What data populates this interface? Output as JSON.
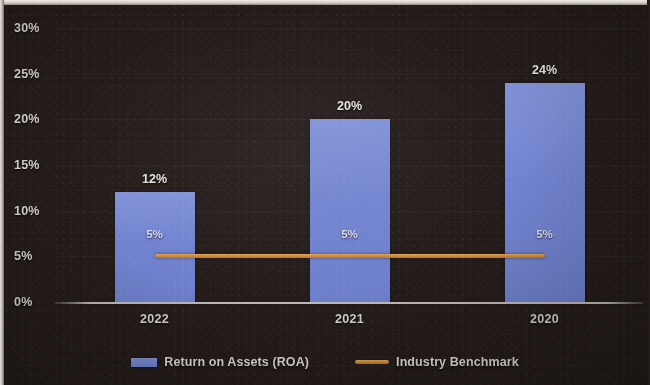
{
  "chart_data": {
    "type": "bar",
    "title": "",
    "xlabel": "",
    "ylabel": "",
    "categories": [
      "2022",
      "2021",
      "2020"
    ],
    "ylim": [
      0,
      30
    ],
    "ytick_labels": [
      "0%",
      "5%",
      "10%",
      "15%",
      "20%",
      "25%",
      "30%"
    ],
    "ytick_values": [
      0,
      5,
      10,
      15,
      20,
      25,
      30
    ],
    "grid": true,
    "legend_position": "bottom",
    "series": [
      {
        "name": "Return on Assets (ROA)",
        "type": "bar",
        "color": "#7183cf",
        "values": [
          12,
          20,
          24
        ],
        "data_labels": [
          "12%",
          "20%",
          "24%"
        ]
      },
      {
        "name": "Industry Benchmark",
        "type": "line",
        "color": "#cf8733",
        "values": [
          5,
          5,
          5
        ],
        "data_labels": [
          "5%",
          "5%",
          "5%"
        ]
      }
    ]
  },
  "colors": {
    "background": "#241c1a",
    "bar": "#7183cf",
    "benchmark": "#cf8733",
    "axis": "#d6d4cf",
    "text": "#dedbd6"
  },
  "legend": {
    "items": [
      {
        "label": "Return on Assets (ROA)",
        "swatch": "bar-swatch"
      },
      {
        "label": "Industry Benchmark",
        "swatch": "line-swatch"
      }
    ]
  }
}
